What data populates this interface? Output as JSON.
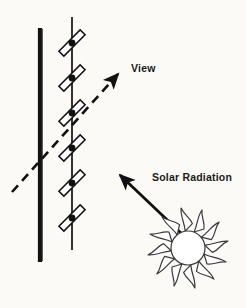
{
  "diagram": {
    "background_color": "#fbfaf7",
    "ink_color": "#1a1a1a",
    "labels": {
      "view": "View",
      "solar_radiation": "Solar Radiation"
    },
    "elements": {
      "wall_bar": {
        "name": "wall-bar",
        "description": "thick solid vertical bar",
        "x": 40,
        "y_top": 28,
        "y_bottom": 262,
        "thickness": 4,
        "color": "#111111"
      },
      "louver_axis": {
        "name": "louver-axis-line",
        "description": "thin vertical support line carrying the louver blades",
        "x": 72,
        "y_top": 17,
        "y_bottom": 250,
        "thickness": 1.6,
        "color": "#111111"
      },
      "louver_blades": {
        "name": "louver-blades",
        "count": 6,
        "blade_length": 30,
        "blade_width": 7,
        "tilt_degrees": -45,
        "pivot_x": 72,
        "pivot_ys": [
          43,
          78,
          113,
          148,
          183,
          218
        ],
        "outline_color": "#111111",
        "fill_color": "#ffffff",
        "pivot_dot_radius": 3.4,
        "pivot_dot_color": "#111111"
      },
      "view_arrow": {
        "name": "view-arrow",
        "style": "dashed",
        "from": [
          12,
          192
        ],
        "to": [
          122,
          70
        ],
        "dash_pattern": "9 6",
        "thickness": 2.6,
        "color": "#111111"
      },
      "solar_arrow": {
        "name": "solar-radiation-arrow",
        "style": "solid",
        "from": [
          182,
          234
        ],
        "to": [
          117,
          172
        ],
        "thickness": 2.8,
        "color": "#111111"
      },
      "sun": {
        "name": "sun-icon",
        "center": [
          188,
          248
        ],
        "core_radius": 17,
        "ray_count": 12,
        "ray_outer_radius": 42,
        "outline_color": "#3a3a3a",
        "fill_color": "#ffffff",
        "stroke_width": 1.2
      }
    }
  }
}
